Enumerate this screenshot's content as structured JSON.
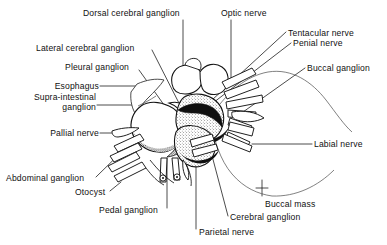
{
  "figure": {
    "background_color": "#ffffff",
    "ink_color": "#101010",
    "text_color": "#101010",
    "width": 387,
    "height": 245
  },
  "labels": [
    {
      "id": "dorsal-cerebral-ganglion",
      "text": "Dorsal cerebral ganglion",
      "x": 83,
      "y": 8,
      "align": "left",
      "leader": "vertical"
    },
    {
      "id": "optic-nerve",
      "text": "Optic nerve",
      "x": 221,
      "y": 8,
      "align": "left",
      "leader": "vertical"
    },
    {
      "id": "tentacular-nerve",
      "text": "Tentacular nerve",
      "x": 288,
      "y": 28,
      "align": "left",
      "leader": "diagonal"
    },
    {
      "id": "penial-nerve",
      "text": "Penial nerve",
      "x": 293,
      "y": 38,
      "align": "left",
      "leader": "diagonal"
    },
    {
      "id": "lateral-cerebral-ganglion",
      "text": "Lateral cerebral ganglion",
      "x": 36,
      "y": 43,
      "align": "left",
      "leader": "diagonal"
    },
    {
      "id": "pleural-ganglion",
      "text": "Pleural ganglion",
      "x": 65,
      "y": 62,
      "align": "left",
      "leader": "diagonal"
    },
    {
      "id": "buccal-ganglion",
      "text": "Buccal ganglion",
      "x": 307,
      "y": 63,
      "align": "left",
      "leader": "diagonal"
    },
    {
      "id": "esophagus",
      "text": "Esophagus",
      "x": 49,
      "y": 83,
      "align": "right",
      "leader": "horizontal"
    },
    {
      "id": "supra-intestinal-ganglion",
      "text": "Supra-intestinal ganglion",
      "x": 22,
      "y": 95,
      "align": "right",
      "leader": "horizontal",
      "lines": [
        "Supra-intestinal",
        "ganglion"
      ]
    },
    {
      "id": "pallial-nerve",
      "text": "Pallial nerve",
      "x": 40,
      "y": 130,
      "align": "right",
      "leader": "horizontal-dash"
    },
    {
      "id": "labial-nerve",
      "text": "Labial nerve",
      "x": 314,
      "y": 140,
      "align": "left",
      "leader": "horizontal"
    },
    {
      "id": "abdominal-ganglion",
      "text": "Abdominal ganglion",
      "x": 6,
      "y": 178,
      "align": "left",
      "leader": "diagonal"
    },
    {
      "id": "otocyst",
      "text": "Otocyst",
      "x": 75,
      "y": 193,
      "align": "left",
      "leader": "diagonal"
    },
    {
      "id": "pedal-ganglion",
      "text": "Pedal ganglion",
      "x": 99,
      "y": 210,
      "align": "left",
      "leader": "vertical"
    },
    {
      "id": "buccal-mass",
      "text": "Buccal mass",
      "x": 265,
      "y": 205,
      "align": "left",
      "leader": "tick"
    },
    {
      "id": "cerebral-ganglion",
      "text": "Cerebral ganglion",
      "x": 230,
      "y": 218,
      "align": "left",
      "leader": "diagonal"
    },
    {
      "id": "parietal-nerve",
      "text": "Parietal nerve",
      "x": 199,
      "y": 231,
      "align": "left",
      "leader": "vertical"
    }
  ]
}
